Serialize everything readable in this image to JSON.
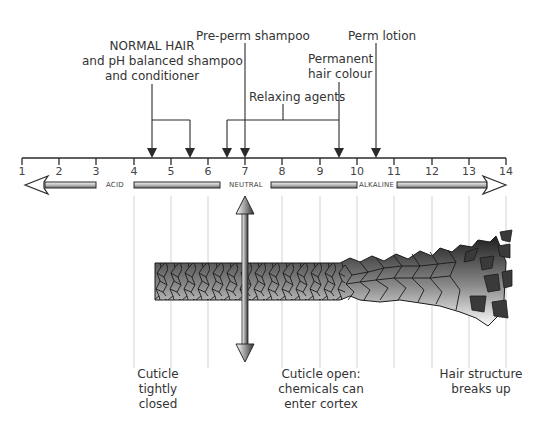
{
  "scale": {
    "min": 1,
    "max": 14,
    "ticks": [
      "1",
      "2",
      "3",
      "4",
      "5",
      "6",
      "7",
      "8",
      "9",
      "10",
      "11",
      "12",
      "13",
      "14"
    ],
    "region_labels": {
      "acid": "ACID",
      "neutral": "NEUTRAL",
      "alkaline": "ALKALINE"
    }
  },
  "annotations": {
    "normal_hair": {
      "lines": [
        "NORMAL HAIR",
        "and pH balanced shampoo",
        "and conditioner"
      ],
      "range": [
        4.5,
        5.5
      ]
    },
    "pre_perm_shampoo": {
      "label": "Pre-perm shampoo",
      "value": 7
    },
    "relaxing_agents": {
      "label": "Relaxing agents",
      "range": [
        6.5,
        9.5
      ]
    },
    "permanent_hair_colour": {
      "lines": [
        "Permanent",
        "hair colour"
      ],
      "value": 9.5
    },
    "perm_lotion": {
      "label": "Perm lotion",
      "value": 10.5
    }
  },
  "captions": {
    "closed": [
      "Cuticle",
      "tightly",
      "closed"
    ],
    "open": [
      "Cuticle open:",
      "chemicals can",
      "enter cortex"
    ],
    "breaks": [
      "Hair structure",
      "breaks up"
    ]
  },
  "colors": {
    "line": "#2a2a2a",
    "grid": "#cfcfcf",
    "text": "#333333"
  }
}
